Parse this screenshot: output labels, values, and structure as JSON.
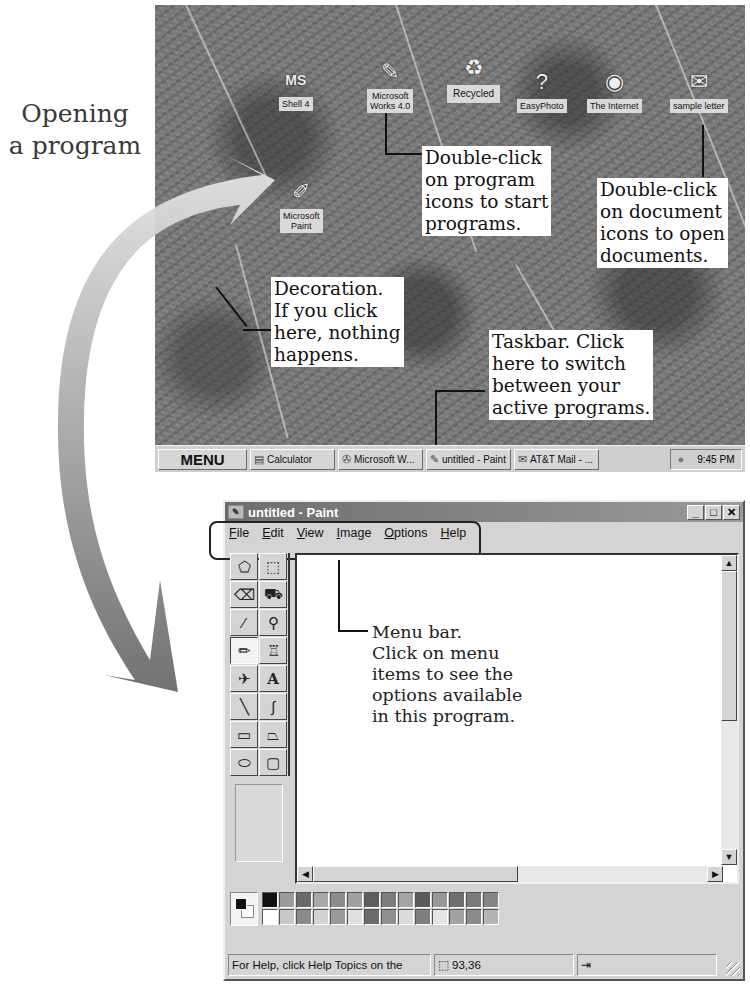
{
  "heading": {
    "line1": "Opening",
    "line2": "a program"
  },
  "desktop": {
    "icons": [
      {
        "name": "ms-dos-shell",
        "glyph": "MS",
        "label": "Shell 4"
      },
      {
        "name": "microsoft-works",
        "glyph": "✎",
        "label": "Microsoft\nWorks 4.0"
      },
      {
        "name": "recycled",
        "glyph": "♻",
        "label": "Recycled"
      },
      {
        "name": "easyphoto",
        "glyph": "?",
        "label": "EasyPhoto"
      },
      {
        "name": "the-internet",
        "glyph": "◉",
        "label": "The Internet"
      },
      {
        "name": "sample-letter",
        "glyph": "✉",
        "label": "sample letter"
      },
      {
        "name": "microsoft-paint",
        "glyph": "✐",
        "label": "Microsoft\nPaint"
      }
    ],
    "callouts": {
      "program_icons": "Double-click\non program\nicons to start\nprograms.",
      "document_icons": "Double-click\non document\nicons to open\ndocuments.",
      "decoration": "Decoration.\nIf you click\nhere, nothing\nhappens.",
      "taskbar": "Taskbar. Click\nhere to switch\nbetween your\nactive programs."
    }
  },
  "taskbar": {
    "menu_label": "MENU",
    "tasks": [
      {
        "icon": "▤",
        "label": "Calculator"
      },
      {
        "icon": "✇",
        "label": "Microsoft W..."
      },
      {
        "icon": "✎",
        "label": "untitled - Paint"
      },
      {
        "icon": "✉",
        "label": "AT&T Mail - ..."
      }
    ],
    "tray": {
      "icon": "●",
      "time": "9:45 PM"
    }
  },
  "paint": {
    "title": "untitled - Paint",
    "window_buttons": {
      "minimize": "_",
      "maximize": "□",
      "close": "✕"
    },
    "menu": [
      {
        "key": "F",
        "rest": "ile"
      },
      {
        "key": "E",
        "rest": "dit"
      },
      {
        "key": "V",
        "rest": "iew"
      },
      {
        "key": "I",
        "rest": "mage"
      },
      {
        "key": "O",
        "rest": "ptions"
      },
      {
        "key": "H",
        "rest": "elp"
      }
    ],
    "tools": [
      {
        "name": "free-form-select",
        "glyph": "⬠"
      },
      {
        "name": "rect-select",
        "glyph": "⬚"
      },
      {
        "name": "eraser",
        "glyph": "⌫"
      },
      {
        "name": "fill-with-color",
        "glyph": "⛟"
      },
      {
        "name": "pick-color",
        "glyph": "⁄"
      },
      {
        "name": "magnifier",
        "glyph": "⚲"
      },
      {
        "name": "pencil",
        "glyph": "✏"
      },
      {
        "name": "brush",
        "glyph": "♖"
      },
      {
        "name": "airbrush",
        "glyph": "✈"
      },
      {
        "name": "text",
        "glyph": "A"
      },
      {
        "name": "line",
        "glyph": "╲"
      },
      {
        "name": "curve",
        "glyph": "∫"
      },
      {
        "name": "rectangle",
        "glyph": "▭"
      },
      {
        "name": "polygon",
        "glyph": "⏢"
      },
      {
        "name": "ellipse",
        "glyph": "⬭"
      },
      {
        "name": "rounded-rectangle",
        "glyph": "▢"
      }
    ],
    "palette_top": [
      "#111111",
      "#9a9a9a",
      "#6a6a6a",
      "#a8a8a8",
      "#8c8c8c",
      "#a0a0a0",
      "#5e5e5e",
      "#7c7c7c",
      "#a4a4a4",
      "#5a5a5a",
      "#989898",
      "#6e6e6e",
      "#7a7a7a",
      "#868686"
    ],
    "palette_bottom": [
      "#ffffff",
      "#c8c8c8",
      "#8a8a8a",
      "#d2d2d2",
      "#9a9a9a",
      "#e0e0e0",
      "#6a6a6a",
      "#8e8e8e",
      "#dcdcdc",
      "#7e7e7e",
      "#e4e4e4",
      "#a2a2a2",
      "#8a8a8a",
      "#b4b4b4"
    ],
    "status": {
      "help_text": "For Help, click Help Topics on the",
      "position_icon": "⬚",
      "position": "93,36",
      "size_icon": "⇥",
      "size": ""
    },
    "callout": "Menu bar.\nClick on menu\nitems to see the\noptions available\nin this program."
  }
}
